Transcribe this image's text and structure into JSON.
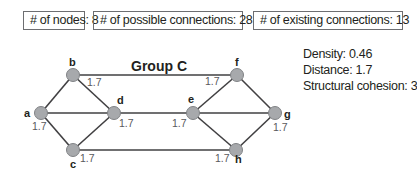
{
  "summary_boxes": [
    {
      "label": "# of nodes: 8"
    },
    {
      "label": "# of possible connections: 28"
    },
    {
      "label": "# of existing connections: 13"
    }
  ],
  "diagram": {
    "title": "Group C",
    "nodes": [
      {
        "id": "a",
        "label": "a",
        "value": "1.7"
      },
      {
        "id": "b",
        "label": "b",
        "value": "1.7"
      },
      {
        "id": "c",
        "label": "c",
        "value": "1.7"
      },
      {
        "id": "d",
        "label": "d",
        "value": "1.7"
      },
      {
        "id": "e",
        "label": "e",
        "value": "1.7"
      },
      {
        "id": "f",
        "label": "f",
        "value": "1.7"
      },
      {
        "id": "g",
        "label": "g",
        "value": "1.7"
      },
      {
        "id": "h",
        "label": "h",
        "value": "1.7"
      }
    ],
    "edges": [
      [
        "a",
        "b"
      ],
      [
        "a",
        "d"
      ],
      [
        "a",
        "c"
      ],
      [
        "b",
        "d"
      ],
      [
        "c",
        "d"
      ],
      [
        "b",
        "f"
      ],
      [
        "d",
        "e"
      ],
      [
        "c",
        "h"
      ],
      [
        "f",
        "e"
      ],
      [
        "f",
        "g"
      ],
      [
        "e",
        "g"
      ],
      [
        "e",
        "h"
      ],
      [
        "h",
        "g"
      ]
    ],
    "colors": {
      "node_fill": "#a7a9ac",
      "node_stroke": "#808285",
      "edge": "#414042"
    }
  },
  "stats": {
    "density": "Density: 0.46",
    "distance": "Distance: 1.7",
    "cohesion": "Structural cohesion: 3"
  }
}
